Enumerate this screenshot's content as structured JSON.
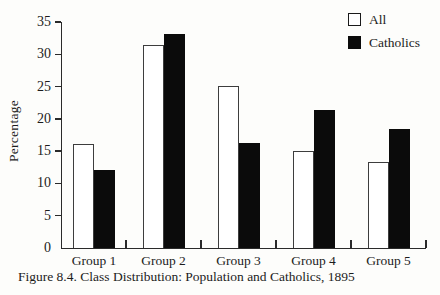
{
  "figure": {
    "caption": "Figure 8.4. Class Distribution: Population and Catholics, 1895"
  },
  "legend": {
    "items": [
      {
        "label": "All",
        "swatch": "white-square-icon"
      },
      {
        "label": "Catholics",
        "swatch": "black-square-icon"
      }
    ]
  },
  "chart_data": {
    "type": "bar",
    "title": "",
    "xlabel": "",
    "ylabel": "Percentage",
    "categories": [
      "Group 1",
      "Group 2",
      "Group 3",
      "Group 4",
      "Group 5"
    ],
    "series": [
      {
        "name": "All",
        "color": "#ffffff",
        "values": [
          16.1,
          31.5,
          25.1,
          15.1,
          13.3
        ]
      },
      {
        "name": "Catholics",
        "color": "#0b0b0b",
        "values": [
          12.1,
          33.2,
          16.3,
          21.3,
          18.4
        ]
      }
    ],
    "ylim": [
      0,
      35
    ],
    "yticks": [
      0,
      5,
      10,
      15,
      20,
      25,
      30,
      35
    ],
    "grid": false,
    "legend_position": "top-right"
  }
}
